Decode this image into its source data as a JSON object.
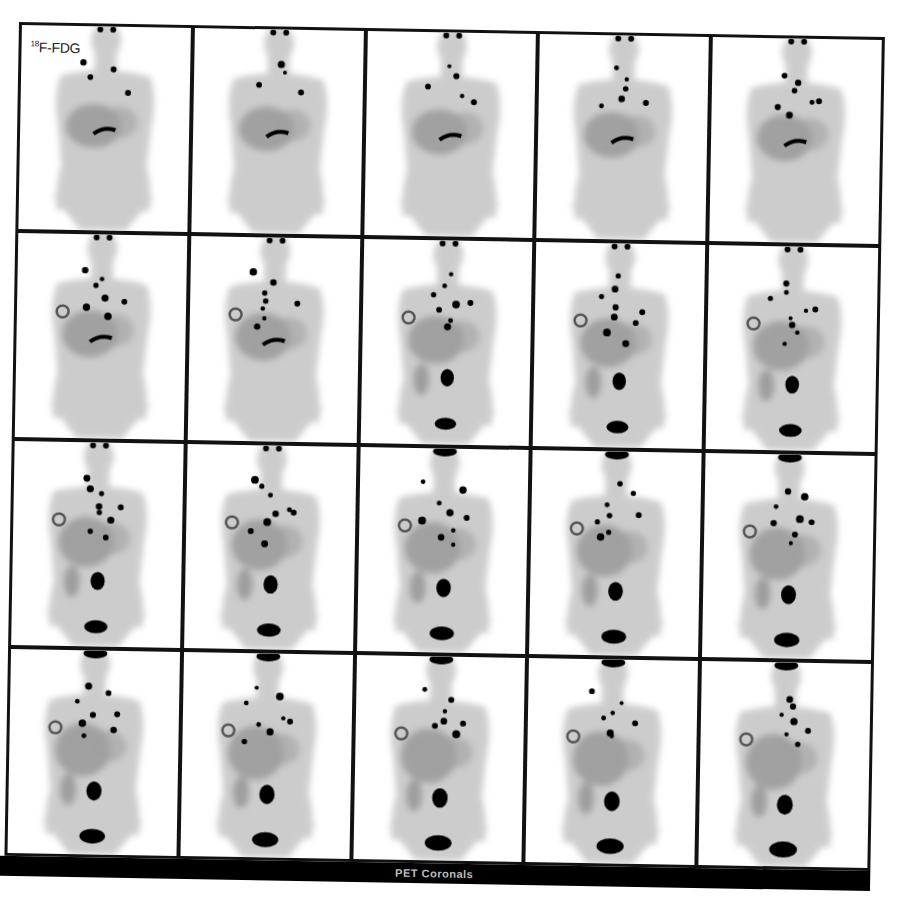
{
  "figure": {
    "tracer_label": {
      "mass_number": "18",
      "text": "F-FDG"
    },
    "caption": "PET Coronals",
    "layout": {
      "rows": 4,
      "columns": 5,
      "total_slices": 20
    },
    "colors": {
      "background": "#ffffff",
      "grid_lines": "#111111",
      "caption_bar": "#000000",
      "caption_text": "#bdbdbd",
      "tissue": "#9a9a9a",
      "hot_spot": "#000000"
    }
  },
  "slices": [
    {
      "index": 1,
      "row": 1,
      "col": 1,
      "features": {
        "heart": false,
        "bladder": false,
        "lesions": 3,
        "kidney": false,
        "ring": false
      }
    },
    {
      "index": 2,
      "row": 1,
      "col": 2,
      "features": {
        "heart": false,
        "bladder": false,
        "lesions": 3,
        "kidney": false,
        "ring": false
      }
    },
    {
      "index": 3,
      "row": 1,
      "col": 3,
      "features": {
        "heart": false,
        "bladder": false,
        "lesions": 4,
        "kidney": false,
        "ring": false
      }
    },
    {
      "index": 4,
      "row": 1,
      "col": 4,
      "features": {
        "heart": false,
        "bladder": false,
        "lesions": 5,
        "kidney": false,
        "ring": false
      }
    },
    {
      "index": 5,
      "row": 1,
      "col": 5,
      "features": {
        "heart": false,
        "bladder": false,
        "lesions": 6,
        "kidney": false,
        "ring": false
      }
    },
    {
      "index": 6,
      "row": 2,
      "col": 1,
      "features": {
        "heart": false,
        "bladder": false,
        "lesions": 6,
        "kidney": false,
        "ring": true
      }
    },
    {
      "index": 7,
      "row": 2,
      "col": 2,
      "features": {
        "heart": false,
        "bladder": false,
        "lesions": 7,
        "kidney": false,
        "ring": true
      }
    },
    {
      "index": 8,
      "row": 2,
      "col": 3,
      "features": {
        "heart": false,
        "bladder": true,
        "lesions": 7,
        "kidney": true,
        "ring": true
      }
    },
    {
      "index": 9,
      "row": 2,
      "col": 4,
      "features": {
        "heart": false,
        "bladder": true,
        "lesions": 8,
        "kidney": true,
        "ring": true
      }
    },
    {
      "index": 10,
      "row": 2,
      "col": 5,
      "features": {
        "heart": false,
        "bladder": true,
        "lesions": 8,
        "kidney": true,
        "ring": true
      }
    },
    {
      "index": 11,
      "row": 3,
      "col": 1,
      "features": {
        "heart": false,
        "bladder": true,
        "lesions": 8,
        "kidney": true,
        "ring": true
      }
    },
    {
      "index": 12,
      "row": 3,
      "col": 2,
      "features": {
        "heart": false,
        "bladder": true,
        "lesions": 8,
        "kidney": true,
        "ring": true
      }
    },
    {
      "index": 13,
      "row": 3,
      "col": 3,
      "features": {
        "heart": false,
        "bladder": true,
        "lesions": 8,
        "kidney": true,
        "ring": true
      }
    },
    {
      "index": 14,
      "row": 3,
      "col": 4,
      "features": {
        "heart": true,
        "bladder": true,
        "lesions": 7,
        "kidney": true,
        "ring": true
      }
    },
    {
      "index": 15,
      "row": 3,
      "col": 5,
      "features": {
        "heart": true,
        "bladder": true,
        "lesions": 7,
        "kidney": true,
        "ring": true
      }
    },
    {
      "index": 16,
      "row": 4,
      "col": 1,
      "features": {
        "heart": true,
        "bladder": true,
        "lesions": 7,
        "kidney": true,
        "ring": true
      }
    },
    {
      "index": 17,
      "row": 4,
      "col": 2,
      "features": {
        "heart": true,
        "bladder": true,
        "lesions": 7,
        "kidney": true,
        "ring": true
      }
    },
    {
      "index": 18,
      "row": 4,
      "col": 3,
      "features": {
        "heart": true,
        "bladder": true,
        "lesions": 6,
        "kidney": true,
        "ring": true
      }
    },
    {
      "index": 19,
      "row": 4,
      "col": 4,
      "features": {
        "heart": true,
        "bladder": true,
        "lesions": 6,
        "kidney": true,
        "ring": true
      }
    },
    {
      "index": 20,
      "row": 4,
      "col": 5,
      "features": {
        "heart": true,
        "bladder": true,
        "lesions": 6,
        "kidney": true,
        "ring": true
      }
    }
  ]
}
